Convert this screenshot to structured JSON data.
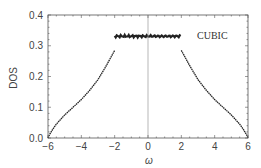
{
  "chart_data": {
    "type": "scatter",
    "title": "",
    "xlabel": "ω",
    "ylabel": "DOS",
    "xlim": [
      -6,
      6
    ],
    "ylim": [
      0,
      0.4
    ],
    "xticks": [
      -6,
      -4,
      -2,
      0,
      2,
      4,
      6
    ],
    "yticks": [
      0.0,
      0.1,
      0.2,
      0.3,
      0.4
    ],
    "xtick_labels": [
      "−6",
      "−4",
      "−2",
      "0",
      "2",
      "4",
      "6"
    ],
    "ytick_labels": [
      "0.0",
      "0.1",
      "0.2",
      "0.3",
      "0.4"
    ],
    "grid": false,
    "legend": null,
    "annotations": [
      {
        "text": "CUBIC",
        "x": 3.7,
        "y": 0.32
      }
    ],
    "vertical_line": {
      "x": 0,
      "color": "#999999"
    },
    "series": [
      {
        "name": "DOS",
        "color": "#222222",
        "x": [
          -6.0,
          -5.9,
          -5.7,
          -5.5,
          -5.0,
          -4.5,
          -4.0,
          -3.5,
          -3.0,
          -2.5,
          -2.2,
          -2.0,
          -2.0,
          -1.5,
          -1.0,
          -0.5,
          0.0,
          0.5,
          1.0,
          1.5,
          2.0,
          2.0,
          2.2,
          2.5,
          3.0,
          3.5,
          4.0,
          4.5,
          5.0,
          5.5,
          5.7,
          5.9,
          6.0
        ],
        "values": [
          0.0,
          0.012,
          0.03,
          0.045,
          0.075,
          0.1,
          0.125,
          0.155,
          0.19,
          0.235,
          0.265,
          0.285,
          0.333,
          0.331,
          0.332,
          0.33,
          0.331,
          0.33,
          0.332,
          0.331,
          0.333,
          0.285,
          0.265,
          0.235,
          0.19,
          0.155,
          0.125,
          0.1,
          0.075,
          0.045,
          0.03,
          0.012,
          0.0
        ]
      }
    ]
  },
  "labels": {
    "ylabel": "DOS",
    "xlabel": "ω",
    "annotation": "CUBIC"
  }
}
